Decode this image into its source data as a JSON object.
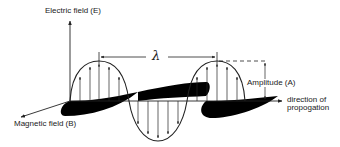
{
  "diagram": {
    "labels": {
      "electric_field": "Electric field  (E)",
      "magnetic_field": "Magnetic field  (B)",
      "wavelength": "λ",
      "amplitude": "Amplitude  (A)",
      "direction_line1": "direction of",
      "direction_line2": "propogation"
    },
    "colors": {
      "stroke": "#222222",
      "fill": "#000000",
      "background": "#ffffff"
    }
  }
}
